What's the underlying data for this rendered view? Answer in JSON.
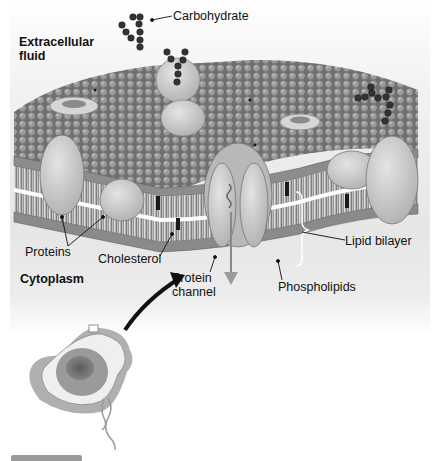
{
  "diagram": {
    "type": "cell-membrane-fluid-mosaic",
    "regions": {
      "top": "Extracellular fluid",
      "bottom": "Cytoplasm"
    },
    "labels": {
      "carbohydrate": "Carbohydrate",
      "extracellular_line1": "Extracellular",
      "extracellular_line2": "fluid",
      "proteins": "Proteins",
      "cholesterol": "Cholesterol",
      "cytoplasm": "Cytoplasm",
      "protein_channel_line1": "Protein",
      "protein_channel_line2": "channel",
      "phospholipids": "Phospholipids",
      "lipid_bilayer": "Lipid bilayer"
    },
    "colors": {
      "background": "#e8e8e8",
      "phospholipid_head": "#8a8a8a",
      "protein": "#cfcfcf",
      "carbohydrate": "#3a3a3a",
      "cholesterol": "#1a1a1a",
      "cell": "#a8a8a8"
    }
  }
}
